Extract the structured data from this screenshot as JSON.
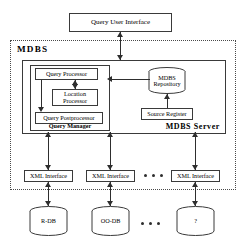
{
  "diagram": {
    "type": "block-architecture",
    "colors": {
      "stroke": "#3a3a3a",
      "connector": "#2e2e2e",
      "background": "#ffffff",
      "dashed_border": "#4a4a4a"
    }
  },
  "nodes": {
    "query_user_interface": {
      "label": "Query User Interface",
      "shape": "rectangle"
    },
    "mdbs_boundary": {
      "label": "MDBS",
      "shape": "dashed-rectangle"
    },
    "mdbs_server": {
      "label": "MDBS Server",
      "shape": "rectangle"
    },
    "query_manager": {
      "label": "Query Manager",
      "shape": "rectangle"
    },
    "query_processor": {
      "label": "Query Processor",
      "shape": "rectangle"
    },
    "location_processor": {
      "label": "Location\nProcessor",
      "shape": "rectangle"
    },
    "query_postprocessor": {
      "label": "Query Postprocessor",
      "shape": "rectangle"
    },
    "mdbs_repository": {
      "label": "MDBS\nRepository",
      "shape": "cylinder"
    },
    "source_register": {
      "label": "Source Register",
      "shape": "rectangle"
    }
  },
  "interfaces": [
    {
      "label": "XML Interface"
    },
    {
      "label": "XML Interface"
    },
    {
      "label": "XML Interface"
    }
  ],
  "databases": [
    {
      "label": "R-DB",
      "shape": "cylinder"
    },
    {
      "label": "OO-DB",
      "shape": "cylinder"
    },
    {
      "label": "?",
      "shape": "cylinder"
    }
  ],
  "ellipsis": {
    "label": "...",
    "meaning": "additional-data-sources"
  },
  "edges": [
    {
      "from": "query_user_interface",
      "to": "mdbs_server",
      "direction": "bidirectional"
    },
    {
      "from": "query_processor",
      "to": "location_processor",
      "direction": "bidirectional"
    },
    {
      "from": "query_processor",
      "to": "query_postprocessor",
      "direction": "down"
    },
    {
      "from": "mdbs_repository",
      "to": "query_manager",
      "direction": "left"
    },
    {
      "from": "source_register",
      "to": "mdbs_repository",
      "direction": "up"
    },
    {
      "from": "mdbs_server",
      "to": "xml_interface_1",
      "direction": "bidirectional"
    },
    {
      "from": "mdbs_server",
      "to": "xml_interface_2",
      "direction": "bidirectional"
    },
    {
      "from": "mdbs_server",
      "to": "xml_interface_3",
      "direction": "bidirectional"
    },
    {
      "from": "xml_interface_1",
      "to": "r_db",
      "direction": "bidirectional"
    },
    {
      "from": "xml_interface_2",
      "to": "oo_db",
      "direction": "bidirectional"
    },
    {
      "from": "xml_interface_3",
      "to": "unknown_db",
      "direction": "bidirectional"
    }
  ]
}
